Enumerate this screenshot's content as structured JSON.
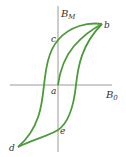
{
  "diagram": {
    "type": "hysteresis-loop",
    "colors": {
      "axis": "#9a9a9a",
      "curve": "#4c9a3c",
      "text": "#333333"
    },
    "axes": {
      "vertical_label_main": "B",
      "vertical_label_sub": "M",
      "horizontal_label_main": "B",
      "horizontal_label_sub": "0"
    },
    "points": {
      "a": "a",
      "b": "b",
      "c": "c",
      "d": "d",
      "e": "e"
    }
  }
}
